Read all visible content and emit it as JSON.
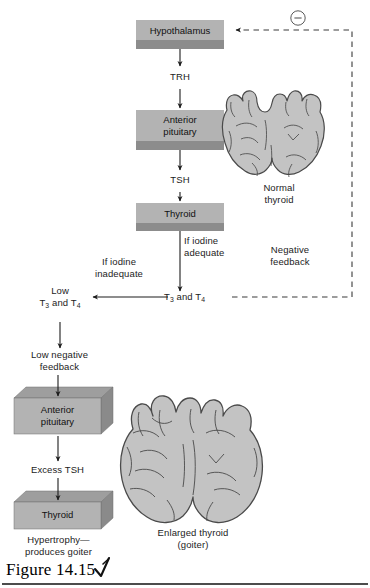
{
  "figure": {
    "caption_label": "Figure 14.15",
    "pen_mark": "check-mark-annotation"
  },
  "diagram": {
    "title_implied": "Thyroid hormone negative feedback and goiter formation",
    "colors": {
      "box_face": "#b3b3b3",
      "box_shadow": "#8c8c8c",
      "box_top": "#9e9e9e",
      "organ_fill": "#c3c3c3",
      "organ_outline": "#4a4a4a",
      "arrow": "#1c1c1c",
      "dashed_feedback": "#3a3a3a"
    },
    "boxes": [
      {
        "id": "hypothalamus",
        "label": "Hypothalamus",
        "style": "flat-slab"
      },
      {
        "id": "anterior-pituitary",
        "label_line1": "Anterior",
        "label_line2": "pituitary",
        "style": "flat-slab"
      },
      {
        "id": "thyroid",
        "label": "Thyroid",
        "style": "flat-slab"
      },
      {
        "id": "anterior-pituitary-2",
        "label_line1": "Anterior",
        "label_line2": "pituitary",
        "style": "iso-block"
      },
      {
        "id": "thyroid-2",
        "label": "Thyroid",
        "style": "iso-block"
      }
    ],
    "arrow_labels": {
      "trh": "TRH",
      "tsh": "TSH",
      "excess_tsh": "Excess TSH"
    },
    "branch_labels": {
      "if_iodine_adequate_line1": "If iodine",
      "if_iodine_adequate_line2": "adequate",
      "if_iodine_inadequate_line1": "If iodine",
      "if_iodine_inadequate_line2": "inadequate"
    },
    "hormone_labels": {
      "t3_t4": "T3 and T4",
      "t3_t4_html": "T<sub>3</sub> and T<sub>4</sub>",
      "low_t3_t4_line1": "Low",
      "low_t3_t4_line2_html": "T<sub>3</sub> and T<sub>4</sub>"
    },
    "feedback": {
      "negative_line1": "Negative",
      "negative_line2": "feedback",
      "low_negative_line1": "Low negative",
      "low_negative_line2": "feedback",
      "minus_symbol": "−",
      "minus_icon_name": "circled-minus-icon"
    },
    "outcome": {
      "hypertrophy_line1": "Hypertrophy—",
      "hypertrophy_line2": "produces goiter"
    },
    "organs": [
      {
        "id": "normal-thyroid",
        "caption_line1": "Normal",
        "caption_line2": "thyroid"
      },
      {
        "id": "enlarged-thyroid",
        "caption_line1": "Enlarged thyroid",
        "caption_line2": "(goiter)"
      }
    ]
  }
}
